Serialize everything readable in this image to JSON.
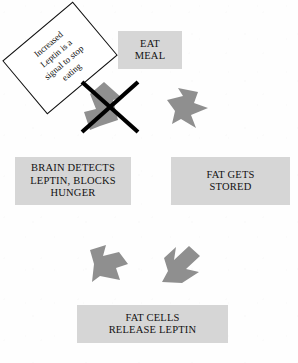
{
  "diagram": {
    "background_color": "#fefefe",
    "box_fill_color": "#d6d6d6",
    "arrow_fill_color": "#8f8f8f",
    "strike_color": "#000000",
    "text_color": "#111111"
  },
  "boxes": {
    "eat_meal": {
      "label": "EAT\nMEAL",
      "line1": "EAT",
      "line2": "MEAL"
    },
    "fat_gets_stored": {
      "label": "FAT GETS\nSTORED",
      "line1": "FAT GETS",
      "line2": "STORED"
    },
    "fat_cells_release_leptin": {
      "label": "FAT CELLS\nRELEASE LEPTIN",
      "line1": "FAT CELLS",
      "line2": "RELEASE LEPTIN"
    },
    "brain_detects": {
      "label": "BRAIN DETECTS\nLEPTIN, BLOCKS\nHUNGER",
      "line1": "BRAIN DETECTS",
      "line2": "LEPTIN, BLOCKS",
      "line3": "HUNGER"
    }
  },
  "callout": {
    "label": "Increased\nLeptin is a\nsignal to stop\neating",
    "line1": "Increased",
    "line2": "Leptin is a",
    "line3": "signal to stop",
    "line4": "eating",
    "rotation_degrees": "-40"
  },
  "arrows": {
    "eat_to_fat": {
      "name": "arrow-down-right-icon",
      "direction": "down-right"
    },
    "fat_to_fatcells": {
      "name": "arrow-down-left-icon",
      "direction": "down-left"
    },
    "fatcells_to_brain": {
      "name": "arrow-up-left-icon",
      "direction": "up-left"
    },
    "brain_to_eat_blocked": {
      "name": "arrow-up-right-icon",
      "direction": "up-right"
    }
  },
  "strike": {
    "name": "x-cross-icon",
    "meaning": "blocked"
  }
}
